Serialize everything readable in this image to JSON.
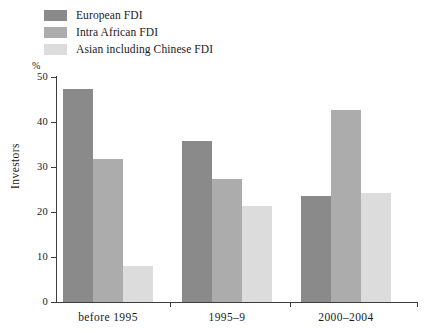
{
  "legend": {
    "items": [
      {
        "label": "European FDI",
        "color": "#8a8a8a",
        "icon": "legend-swatch-icon"
      },
      {
        "label": "Intra African FDI",
        "color": "#acacac",
        "icon": "legend-swatch-icon"
      },
      {
        "label": "Asian including Chinese FDI",
        "color": "#dcdcdc",
        "icon": "legend-swatch-icon"
      }
    ]
  },
  "axes": {
    "unit_marker": "%",
    "ylabel": "Investors",
    "yticks": [
      "50",
      "40",
      "30",
      "20",
      "10",
      "0"
    ]
  },
  "chart_data": {
    "type": "bar",
    "title": "",
    "xlabel": "",
    "ylabel": "Investors",
    "yunit": "%",
    "ylim": [
      0,
      50
    ],
    "ytick_values": [
      0,
      10,
      20,
      30,
      40,
      50
    ],
    "grid": false,
    "legend_position": "top-left",
    "categories": [
      "before 1995",
      "1995–9",
      "2000–2004"
    ],
    "series": [
      {
        "name": "European FDI",
        "color": "#8a8a8a",
        "values": [
          47.3,
          35.8,
          23.5
        ]
      },
      {
        "name": "Intra African FDI",
        "color": "#acacac",
        "values": [
          31.7,
          27.4,
          42.6
        ]
      },
      {
        "name": "Asian including Chinese FDI",
        "color": "#dcdcdc",
        "values": [
          7.9,
          21.4,
          24.2
        ]
      }
    ]
  }
}
